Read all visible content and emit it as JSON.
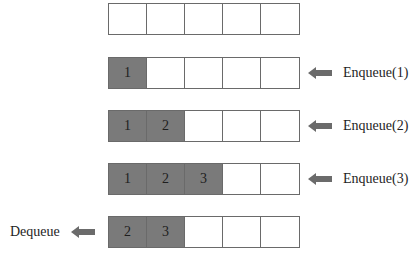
{
  "diagram": {
    "title": "",
    "type": "queue-operations",
    "colors": {
      "filled": "#7a7a7a",
      "empty": "#ffffff",
      "border": "#6a6a6a",
      "arrow": "#6b6b6b"
    },
    "rows": [
      {
        "cells": [
          "",
          "",
          "",
          "",
          ""
        ],
        "filled": [
          false,
          false,
          false,
          false,
          false
        ],
        "operation": null
      },
      {
        "cells": [
          "1",
          "",
          "",
          "",
          ""
        ],
        "filled": [
          true,
          false,
          false,
          false,
          false
        ],
        "operation": {
          "label": "Enqueue(1)",
          "side": "right"
        }
      },
      {
        "cells": [
          "1",
          "2",
          "",
          "",
          ""
        ],
        "filled": [
          true,
          true,
          false,
          false,
          false
        ],
        "operation": {
          "label": "Enqueue(2)",
          "side": "right"
        }
      },
      {
        "cells": [
          "1",
          "2",
          "3",
          "",
          ""
        ],
        "filled": [
          true,
          true,
          true,
          false,
          false
        ],
        "operation": {
          "label": "Enqueue(3)",
          "side": "right"
        }
      },
      {
        "cells": [
          "2",
          "3",
          "",
          "",
          ""
        ],
        "filled": [
          true,
          true,
          false,
          false,
          false
        ],
        "operation": {
          "label": "Dequeue",
          "side": "left"
        }
      }
    ]
  }
}
